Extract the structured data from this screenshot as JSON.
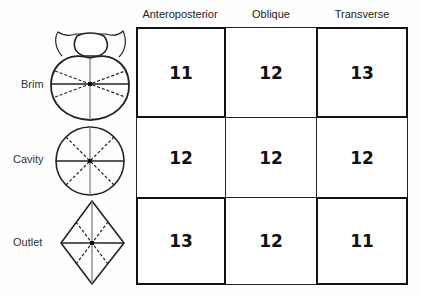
{
  "columns": [
    "Anteroposterior",
    "Oblique",
    "Transverse"
  ],
  "rows": [
    {
      "label": "Brim",
      "shape": "brim-heart-shape",
      "values": [
        "11",
        "12",
        "13"
      ],
      "emphasis": [
        true,
        false,
        true
      ]
    },
    {
      "label": "Cavity",
      "shape": "cavity-circle-shape",
      "values": [
        "12",
        "12",
        "12"
      ],
      "emphasis": [
        true,
        false,
        true
      ]
    },
    {
      "label": "Outlet",
      "shape": "outlet-diamond-shape",
      "values": [
        "13",
        "12",
        "11"
      ],
      "emphasis": [
        true,
        false,
        true
      ]
    }
  ]
}
